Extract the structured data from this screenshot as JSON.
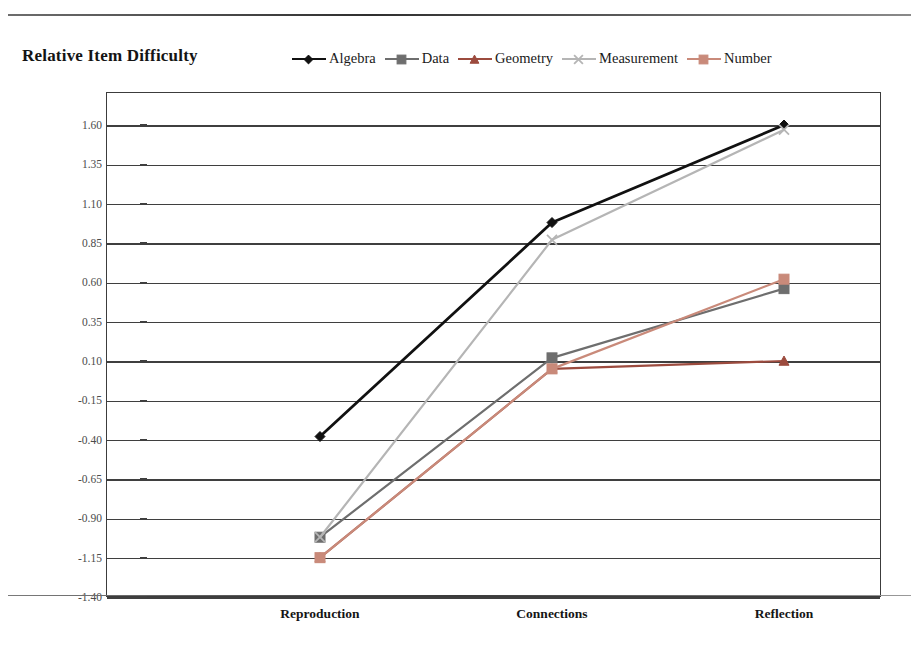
{
  "page": {
    "partial_header_text": "",
    "background": "#ffffff"
  },
  "chart_title": "Relative Item Difficulty",
  "legend": {
    "position": "top-right",
    "items": [
      {
        "label": "Algebra",
        "color": "#111111",
        "marker": "diamond"
      },
      {
        "label": "Data",
        "color": "#6e6e6e",
        "marker": "square"
      },
      {
        "label": "Geometry",
        "color": "#9c4b3e",
        "marker": "triangle"
      },
      {
        "label": "Measurement",
        "color": "#b5b5b5",
        "marker": "x"
      },
      {
        "label": "Number",
        "color": "#c98a7a",
        "marker": "square"
      }
    ]
  },
  "axes": {
    "y_ticks": [
      "1.60",
      "1.35",
      "1.10",
      "0.85",
      "0.60",
      "0.35",
      "0.10",
      "-0.15",
      "-0.40",
      "-0.65",
      "-0.90",
      "-1.15",
      "-1.40"
    ],
    "y_min": -1.4,
    "y_max": 1.6,
    "y_step": 0.25,
    "x_categories": [
      "Reproduction",
      "Connections",
      "Reflection"
    ]
  },
  "chart_data": {
    "type": "line",
    "title": "Relative Item Difficulty",
    "xlabel": "",
    "ylabel": "",
    "categories": [
      "Reproduction",
      "Connections",
      "Reflection"
    ],
    "ylim": [
      -1.4,
      1.6
    ],
    "ytick_step": 0.25,
    "grid": true,
    "legend_position": "top-right",
    "series": [
      {
        "name": "Algebra",
        "color": "#111111",
        "marker": "diamond",
        "values": [
          -0.38,
          0.98,
          1.6
        ]
      },
      {
        "name": "Data",
        "color": "#6e6e6e",
        "marker": "square",
        "values": [
          -1.02,
          0.12,
          0.56
        ]
      },
      {
        "name": "Geometry",
        "color": "#9c4b3e",
        "marker": "triangle",
        "values": [
          -1.15,
          0.05,
          0.1
        ]
      },
      {
        "name": "Measurement",
        "color": "#b5b5b5",
        "marker": "x",
        "values": [
          -1.02,
          0.87,
          1.57
        ]
      },
      {
        "name": "Number",
        "color": "#c98a7a",
        "marker": "square",
        "values": [
          -1.15,
          0.05,
          0.62
        ]
      }
    ]
  }
}
